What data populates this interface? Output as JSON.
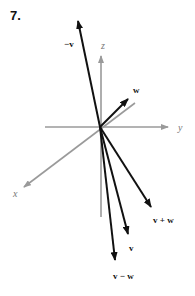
{
  "problem": {
    "number": "7."
  },
  "colors": {
    "axis": "#9a9a9a",
    "vector": "#111111",
    "axis_label": "#777777"
  },
  "axes": {
    "z": {
      "label": "z"
    },
    "y": {
      "label": "y"
    },
    "x": {
      "label": "x"
    }
  },
  "vectors": {
    "neg_v": {
      "label": "−v"
    },
    "w": {
      "label": "w"
    },
    "v_plus_w": {
      "label": "v + w"
    },
    "v": {
      "label": "v"
    },
    "v_minus_w": {
      "label": "v −  w"
    }
  }
}
